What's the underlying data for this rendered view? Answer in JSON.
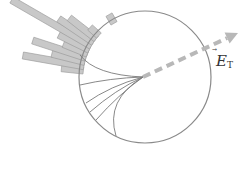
{
  "diagram": {
    "circle": {
      "cx": 145,
      "cy": 77,
      "r": 66,
      "stroke": "#8a8a8a"
    },
    "focus": {
      "x": 143,
      "y": 77
    },
    "vector": {
      "label_main": "E",
      "label_sub": "T",
      "label_accent": "vector-arrow",
      "color": "#b8b8b8",
      "from": [
        143,
        77
      ],
      "to": [
        238,
        33
      ]
    },
    "bars": {
      "fill": "#c8c8c8",
      "stroke": "#9a9a9a",
      "items": [
        {
          "angle": 203,
          "length": 6
        },
        {
          "angle": 186,
          "length": 18
        },
        {
          "angle": 190,
          "length": 58
        },
        {
          "angle": 194,
          "length": 30
        },
        {
          "angle": 198,
          "length": 52
        },
        {
          "angle": 202,
          "length": 22
        },
        {
          "angle": 206,
          "length": 30
        },
        {
          "angle": 210,
          "length": 88
        },
        {
          "angle": 214,
          "length": 38
        },
        {
          "angle": 218,
          "length": 30
        },
        {
          "angle": 222,
          "length": 8
        },
        {
          "angle": 240,
          "length": 6
        }
      ]
    },
    "curves": [
      "M 80 55 Q 95 75 143 77",
      "M 80 85 Q 110 78 143 77",
      "M 86 103 Q 110 86 143 77",
      "M 90 112 Q 115 90 143 77",
      "M 96 120 Q 118 95 143 77",
      "M 116 136 Q 105 100 143 77"
    ]
  }
}
